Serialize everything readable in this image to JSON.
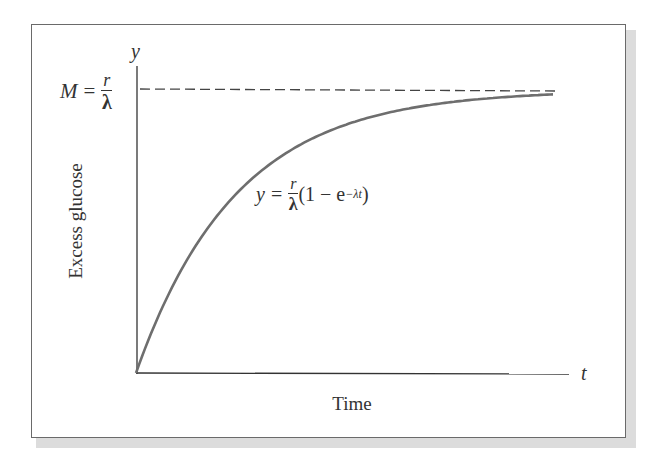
{
  "chart_data": {
    "type": "line",
    "title": "",
    "xlabel": "Time",
    "ylabel": "Excess glucose",
    "x_axis_var": "t",
    "y_axis_var": "y",
    "asymptote": {
      "label_lhs": "M",
      "label_eq": "=",
      "label_num": "r",
      "label_den": "λ",
      "style": "dashed",
      "value_fraction_of_M": 1.0
    },
    "curve": {
      "equation_lhs": "y",
      "equation_eq": "=",
      "equation_num": "r",
      "equation_den": "λ",
      "equation_body": "(1 − e",
      "equation_exp": "−λt",
      "equation_close": ")",
      "form": "y = (r/λ)(1 − e^(−λt))",
      "color": "#6e6e6e",
      "x": [
        0,
        0.5,
        1,
        1.5,
        2,
        2.5,
        3,
        3.5,
        4
      ],
      "y_fraction_of_M": [
        0,
        0.39,
        0.63,
        0.78,
        0.86,
        0.92,
        0.95,
        0.97,
        0.98
      ]
    },
    "grid": false,
    "legend": null,
    "ticks": "none"
  }
}
